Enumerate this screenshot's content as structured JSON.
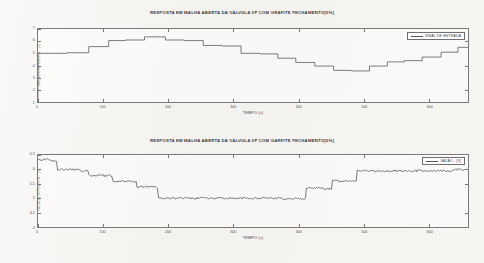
{
  "document": {
    "kind": "scanned-figure-page",
    "background_color": "#f4f2ef"
  },
  "figures": [
    {
      "id": "top",
      "title": "RESPOSTA EM MALHA ABERTA DA VÁLVULA I/P COM GRAFITE FECHAMENTO[5%]",
      "legend": "SINAL DE ENTRADA",
      "xlabel": "TEMPO (s)",
      "ylabel": "VAZÃO DA PLANTA - [V]"
    },
    {
      "id": "bottom",
      "title": "RESPOSTA EM MALHA ABERTA DA VÁLVULA I/P COM GARFITE FECHAMENTO[5%]",
      "legend": "VAZÃO - [V]",
      "xlabel": "TEMPO (s)",
      "ylabel": "VAZÃO DA PLANTA - [V]"
    }
  ],
  "chart_data": [
    {
      "type": "line",
      "id": "input-signal-staircase",
      "title": "RESPOSTA EM MALHA ABERTA DA VÁLVULA I/P COM GRAFITE FECHAMENTO[5%]",
      "xlabel": "TEMPO (s)",
      "ylabel": "VAZÃO DA PLANTA - [V]",
      "legend": [
        "SINAL DE ENTRADA"
      ],
      "legend_position": "top-right",
      "grid": false,
      "xlim": [
        0,
        660
      ],
      "ylim": [
        1,
        7
      ],
      "xticks": [
        0,
        100,
        200,
        300,
        400,
        500,
        600
      ],
      "xticklabels": [
        "0",
        "100",
        "200",
        "300",
        "400",
        "500",
        "600"
      ],
      "yticks": [
        1,
        2,
        3,
        4,
        5,
        6,
        7
      ],
      "yticklabels": [
        "1",
        "2",
        "3",
        "4",
        "5",
        "6",
        "7"
      ],
      "series": [
        {
          "name": "SINAL DE ENTRADA",
          "style": "step",
          "color": "#555555",
          "x": [
            0,
            8,
            45,
            78,
            108,
            135,
            163,
            196,
            225,
            253,
            283,
            311,
            340,
            368,
            396,
            425,
            453,
            481,
            508,
            536,
            562,
            590,
            618,
            645,
            660
          ],
          "y": [
            1.0,
            5.0,
            5.05,
            5.5,
            6.0,
            6.05,
            6.3,
            6.0,
            5.95,
            5.55,
            5.5,
            4.9,
            4.85,
            4.5,
            4.15,
            3.85,
            3.5,
            3.45,
            3.85,
            4.2,
            4.3,
            4.6,
            5.0,
            5.4,
            5.4
          ]
        }
      ]
    },
    {
      "type": "line",
      "id": "plant-flow-response",
      "title": "RESPOSTA EM MALHA ABERTA DA VÁLVULA I/P COM GARFITE FECHAMENTO[5%]",
      "xlabel": "TEMPO (s)",
      "ylabel": "VAZÃO DA PLANTA - [V]",
      "legend": [
        "VAZÃO - [V]"
      ],
      "legend_position": "top-right",
      "grid": false,
      "xlim": [
        0,
        660
      ],
      "ylim": [
        4,
        6.5
      ],
      "xticks": [
        0,
        100,
        200,
        300,
        400,
        500,
        600
      ],
      "xticklabels": [
        "0",
        "100",
        "200",
        "300",
        "400",
        "500",
        "600"
      ],
      "yticks": [
        4,
        4.5,
        5,
        5.5,
        6,
        6.5
      ],
      "yticklabels": [
        "4",
        "4.5",
        "5",
        "5.5",
        "6",
        "6.5"
      ],
      "noise_amplitude": 0.035,
      "series": [
        {
          "name": "VAZÃO - [V]",
          "style": "noisy-step",
          "color": "#4a4a4a",
          "x": [
            0,
            22,
            30,
            68,
            78,
            105,
            115,
            140,
            152,
            175,
            185,
            400,
            412,
            440,
            452,
            478,
            490,
            655
          ],
          "y": [
            6.35,
            6.3,
            6.0,
            5.95,
            5.8,
            5.78,
            5.6,
            5.58,
            5.4,
            5.38,
            5.0,
            4.98,
            5.35,
            5.33,
            5.6,
            5.58,
            5.95,
            6.0
          ]
        }
      ]
    }
  ]
}
